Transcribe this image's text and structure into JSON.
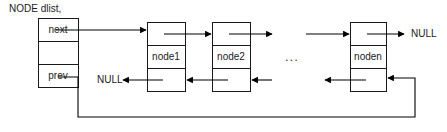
{
  "diagram": {
    "title": "NODE dlist,",
    "type": "doubly-linked-list",
    "head": {
      "name": "dlist",
      "cells": [
        {
          "label": "next"
        },
        {
          "label": ""
        },
        {
          "label": "prev"
        }
      ]
    },
    "nodes": [
      {
        "label": "node1",
        "cells": [
          {
            "label": ""
          },
          {
            "label": "node1"
          },
          {
            "label": ""
          }
        ]
      },
      {
        "label": "node2",
        "cells": [
          {
            "label": ""
          },
          {
            "label": "node2"
          },
          {
            "label": ""
          }
        ]
      },
      {
        "label": "noden",
        "cells": [
          {
            "label": ""
          },
          {
            "label": "noden"
          },
          {
            "label": ""
          }
        ]
      }
    ],
    "ellipsis": "...",
    "terminators": [
      {
        "name": "null-left",
        "label": "NULL"
      },
      {
        "name": "null-right",
        "label": "NULL"
      }
    ],
    "colors": {
      "line": "#000000",
      "box_border": "#1a1a1a",
      "background": "#ffffff",
      "text": "#1a1a1a"
    }
  }
}
